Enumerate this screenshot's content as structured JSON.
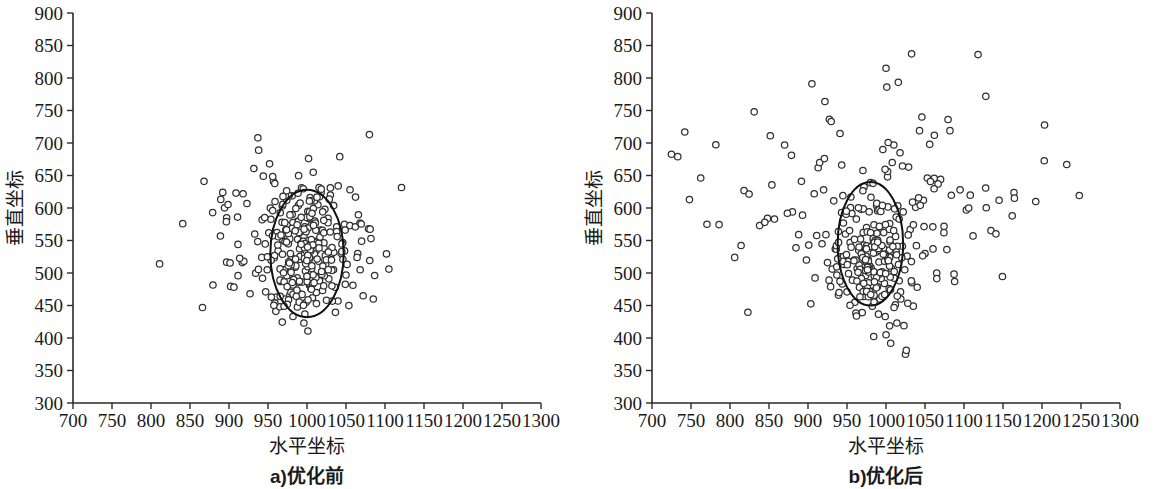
{
  "figure": {
    "type": "scatter-pair",
    "background": "#ffffff",
    "marker_color": "#ffffff",
    "marker_stroke": "#2f2f2f",
    "axis_color": "#2b2b2b",
    "ellipse_color": "#111111"
  },
  "chart_data": [
    {
      "type": "scatter",
      "panel_id": "a",
      "title": "",
      "caption": "a)优化前",
      "xlabel": "水平坐标",
      "ylabel": "垂直坐标",
      "xlim": [
        700,
        1300
      ],
      "ylim": [
        300,
        900
      ],
      "xticks": [
        700,
        750,
        800,
        850,
        900,
        950,
        1000,
        1050,
        1100,
        1150,
        1200,
        1250,
        1300
      ],
      "yticks": [
        300,
        350,
        400,
        450,
        500,
        550,
        600,
        650,
        700,
        750,
        800,
        850,
        900
      ],
      "xtick_labels": [
        "700",
        "750",
        "800",
        "850",
        "900",
        "950",
        "1000",
        "1050",
        "1100",
        "1150",
        "1200",
        "1250",
        "1300"
      ],
      "ytick_labels": [
        "300",
        "350",
        "400",
        "450",
        "500",
        "550",
        "600",
        "650",
        "700",
        "750",
        "800",
        "850",
        "900"
      ],
      "grid": false,
      "legend": "none",
      "marker": "open-circle",
      "marker_radius_px": 3.2,
      "ellipse": {
        "cx": 1000,
        "cy": 530,
        "rx": 47,
        "ry": 98,
        "rotation_deg": 0
      },
      "n_points": 232,
      "cluster": {
        "label": "main-cluster",
        "n": 168,
        "x_mean": 1000,
        "x_sd": 25,
        "y_mean": 525,
        "y_sd": 46,
        "seed": 20250117
      },
      "scatter_outliers": {
        "label": "outliers",
        "n": 64,
        "x_mean": 985,
        "x_sd": 68,
        "y_mean": 560,
        "y_sd": 62,
        "seed": 7731
      },
      "points": [
        [
          811,
          514
        ],
        [
          866,
          447
        ],
        [
          868,
          641
        ],
        [
          889,
          557
        ],
        [
          892,
          624
        ],
        [
          897,
          585
        ],
        [
          909,
          623
        ],
        [
          911,
          586
        ],
        [
          917,
          516
        ],
        [
          918,
          622
        ],
        [
          919,
          518
        ],
        [
          923,
          607
        ],
        [
          927,
          468
        ],
        [
          933,
          560
        ],
        [
          937,
          708
        ],
        [
          938,
          689
        ],
        [
          942,
          524
        ],
        [
          943,
          492
        ],
        [
          944,
          649
        ],
        [
          947,
          471
        ],
        [
          949,
          505
        ],
        [
          951,
          562
        ],
        [
          952,
          668
        ],
        [
          953,
          600
        ],
        [
          956,
          596
        ],
        [
          957,
          641
        ],
        [
          959,
          610
        ],
        [
          960,
          441
        ],
        [
          961,
          463
        ],
        [
          963,
          534
        ],
        [
          965,
          448
        ],
        [
          966,
          487
        ],
        [
          968,
          578
        ],
        [
          969,
          551
        ],
        [
          971,
          505
        ],
        [
          972,
          460
        ],
        [
          974,
          612
        ],
        [
          975,
          546
        ],
        [
          977,
          497
        ],
        [
          978,
          466
        ],
        [
          980,
          524
        ],
        [
          981,
          590
        ],
        [
          982,
          433
        ],
        [
          984,
          575
        ],
        [
          985,
          509
        ],
        [
          986,
          489
        ],
        [
          988,
          552
        ],
        [
          989,
          604
        ],
        [
          990,
          468
        ],
        [
          991,
          521
        ],
        [
          993,
          631
        ],
        [
          994,
          486
        ],
        [
          995,
          546
        ],
        [
          996,
          423
        ],
        [
          997,
          571
        ],
        [
          998,
          503
        ],
        [
          999,
          455
        ],
        [
          1000,
          528
        ],
        [
          1001,
          595
        ],
        [
          1002,
          676
        ],
        [
          1003,
          482
        ],
        [
          1004,
          616
        ],
        [
          1005,
          541
        ],
        [
          1006,
          507
        ],
        [
          1007,
          462
        ],
        [
          1008,
          655
        ],
        [
          1009,
          527
        ],
        [
          1010,
          580
        ],
        [
          1011,
          495
        ],
        [
          1012,
          470
        ],
        [
          1013,
          549
        ],
        [
          1014,
          605
        ],
        [
          1015,
          518
        ],
        [
          1016,
          488
        ],
        [
          1017,
          566
        ],
        [
          1018,
          624
        ],
        [
          1019,
          502
        ],
        [
          1020,
          473
        ],
        [
          1022,
          538
        ],
        [
          1023,
          598
        ],
        [
          1024,
          513
        ],
        [
          1025,
          458
        ],
        [
          1027,
          584
        ],
        [
          1028,
          491
        ],
        [
          1030,
          620
        ],
        [
          1032,
          530
        ],
        [
          1034,
          505
        ],
        [
          1036,
          478
        ],
        [
          1038,
          571
        ],
        [
          1040,
          634
        ],
        [
          1042,
          679
        ],
        [
          1046,
          521
        ],
        [
          1048,
          575
        ],
        [
          1050,
          497
        ],
        [
          1055,
          573
        ],
        [
          1062,
          571
        ],
        [
          1065,
          530
        ],
        [
          1070,
          549
        ],
        [
          1072,
          465
        ],
        [
          1080,
          713
        ],
        [
          1082,
          553
        ],
        [
          1085,
          460
        ],
        [
          1105,
          506
        ]
      ]
    },
    {
      "type": "scatter",
      "panel_id": "b",
      "title": "",
      "caption": "b)优化后",
      "xlabel": "水平坐标",
      "ylabel": "垂直坐标",
      "xlim": [
        700,
        1300
      ],
      "ylim": [
        300,
        900
      ],
      "xticks": [
        700,
        750,
        800,
        850,
        900,
        950,
        1000,
        1050,
        1100,
        1150,
        1200,
        1250,
        1300
      ],
      "yticks": [
        300,
        350,
        400,
        450,
        500,
        550,
        600,
        650,
        700,
        750,
        800,
        850,
        900
      ],
      "xtick_labels": [
        "700",
        "750",
        "800",
        "850",
        "900",
        "950",
        "1000",
        "1050",
        "1100",
        "1150",
        "1200",
        "1250",
        "1300"
      ],
      "ytick_labels": [
        "300",
        "350",
        "400",
        "450",
        "500",
        "550",
        "600",
        "650",
        "700",
        "750",
        "800",
        "850",
        "900"
      ],
      "grid": false,
      "legend": "none",
      "marker": "open-circle",
      "marker_radius_px": 3.2,
      "ellipse": {
        "cx": 980,
        "cy": 545,
        "rx": 42,
        "ry": 95,
        "rotation_deg": 0
      },
      "n_points": 214,
      "cluster": {
        "label": "main-cluster",
        "n": 140,
        "x_mean": 982,
        "x_sd": 22,
        "y_mean": 520,
        "y_sd": 48,
        "seed": 33109
      },
      "scatter_outliers": {
        "label": "outliers",
        "n": 74,
        "x_mean": 1000,
        "x_sd": 115,
        "y_mean": 600,
        "y_sd": 88,
        "seed": 9041
      },
      "points": [
        [
          733,
          679
        ],
        [
          742,
          717
        ],
        [
          748,
          613
        ],
        [
          806,
          524
        ],
        [
          818,
          627
        ],
        [
          831,
          748
        ],
        [
          838,
          573
        ],
        [
          848,
          584
        ],
        [
          857,
          583
        ],
        [
          870,
          697
        ],
        [
          880,
          594
        ],
        [
          893,
          589
        ],
        [
          898,
          520
        ],
        [
          901,
          543
        ],
        [
          905,
          791
        ],
        [
          908,
          622
        ],
        [
          913,
          662
        ],
        [
          915,
          670
        ],
        [
          918,
          545
        ],
        [
          920,
          628
        ],
        [
          921,
          676
        ],
        [
          923,
          559
        ],
        [
          925,
          516
        ],
        [
          927,
          489
        ],
        [
          929,
          479
        ],
        [
          931,
          506
        ],
        [
          933,
          611
        ],
        [
          935,
          537
        ],
        [
          937,
          497
        ],
        [
          939,
          466
        ],
        [
          941,
          525
        ],
        [
          943,
          593
        ],
        [
          944,
          483
        ],
        [
          946,
          513
        ],
        [
          948,
          560
        ],
        [
          950,
          471
        ],
        [
          952,
          499
        ],
        [
          954,
          547
        ],
        [
          955,
          617
        ],
        [
          957,
          489
        ],
        [
          959,
          520
        ],
        [
          960,
          455
        ],
        [
          962,
          583
        ],
        [
          963,
          507
        ],
        [
          965,
          535
        ],
        [
          966,
          478
        ],
        [
          968,
          598
        ],
        [
          969,
          512
        ],
        [
          971,
          464
        ],
        [
          972,
          543
        ],
        [
          974,
          496
        ],
        [
          975,
          570
        ],
        [
          977,
          521
        ],
        [
          978,
          485
        ],
        [
          980,
          639
        ],
        [
          981,
          508
        ],
        [
          983,
          472
        ],
        [
          984,
          551
        ],
        [
          985,
          495
        ],
        [
          987,
          532
        ],
        [
          988,
          604
        ],
        [
          989,
          479
        ],
        [
          991,
          517
        ],
        [
          992,
          460
        ],
        [
          993,
          564
        ],
        [
          995,
          502
        ],
        [
          996,
          690
        ],
        [
          997,
          538
        ],
        [
          998,
          484
        ],
        [
          999,
          433
        ],
        [
          1000,
          815
        ],
        [
          1001,
          786
        ],
        [
          1002,
          648
        ],
        [
          1003,
          521
        ],
        [
          1004,
          476
        ],
        [
          1005,
          548
        ],
        [
          1006,
          392
        ],
        [
          1007,
          507
        ],
        [
          1008,
          670
        ],
        [
          1009,
          494
        ],
        [
          1010,
          697
        ],
        [
          1011,
          531
        ],
        [
          1012,
          451
        ],
        [
          1013,
          586
        ],
        [
          1014,
          423
        ],
        [
          1016,
          513
        ],
        [
          1017,
          488
        ],
        [
          1018,
          685
        ],
        [
          1019,
          460
        ],
        [
          1021,
          541
        ],
        [
          1022,
          594
        ],
        [
          1023,
          419
        ],
        [
          1024,
          505
        ],
        [
          1025,
          375
        ],
        [
          1026,
          381
        ],
        [
          1027,
          526
        ],
        [
          1029,
          663
        ],
        [
          1031,
          567
        ],
        [
          1033,
          485
        ],
        [
          1035,
          449
        ],
        [
          1038,
          601
        ],
        [
          1040,
          478
        ],
        [
          1043,
          719
        ],
        [
          1046,
          740
        ],
        [
          1048,
          612
        ],
        [
          1050,
          530
        ],
        [
          1053,
          646
        ],
        [
          1056,
          698
        ],
        [
          1060,
          571
        ],
        [
          1062,
          712
        ],
        [
          1065,
          500
        ],
        [
          1070,
          644
        ],
        [
          1078,
          536
        ],
        [
          1082,
          719
        ],
        [
          1088,
          487
        ],
        [
          1095,
          628
        ],
        [
          1103,
          597
        ],
        [
          1106,
          600
        ],
        [
          1118,
          836
        ],
        [
          1145,
          612
        ],
        [
          1192,
          610
        ]
      ]
    }
  ],
  "panels": [
    {
      "id": "a",
      "caption": "a)优化前",
      "xlabel": "水平坐标",
      "ylabel": "垂直坐标"
    },
    {
      "id": "b",
      "caption": "b)优化后",
      "xlabel": "水平坐标",
      "ylabel": "垂直坐标"
    }
  ]
}
